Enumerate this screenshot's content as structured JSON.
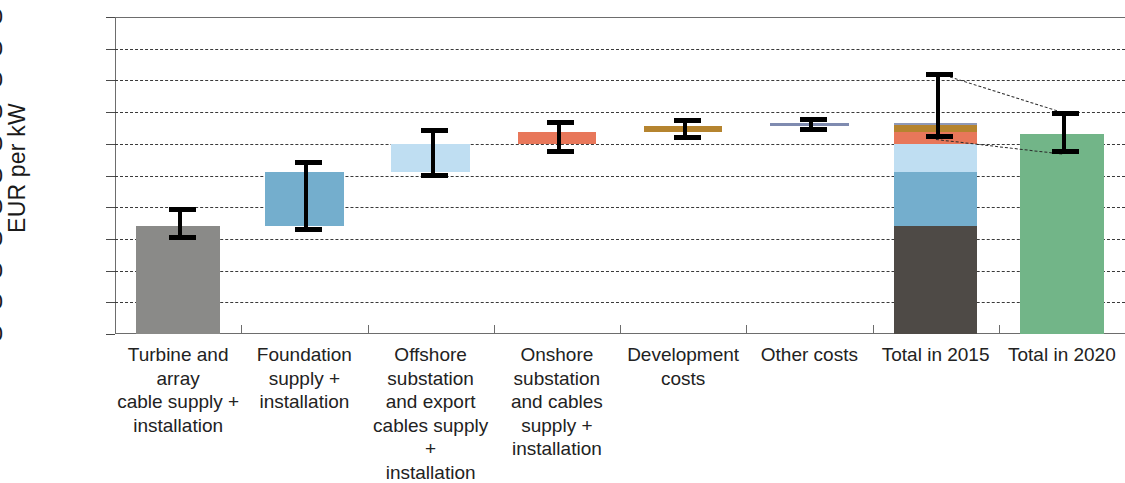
{
  "chart_data": {
    "type": "bar",
    "title": "",
    "subtitle": "",
    "xlabel": "",
    "ylabel": "EUR per kW",
    "ylim": [
      0,
      5000
    ],
    "ytick_interval": 500,
    "grid": "horizontal-dashed",
    "legend": "none",
    "ytick_labels": [
      "5 000",
      "4 500",
      "4 000",
      "3 500",
      "3 000",
      "2 500",
      "2 000",
      "1 500",
      "1 000",
      "500",
      "0"
    ],
    "ytick_values": [
      5000,
      4500,
      4000,
      3500,
      3000,
      2500,
      2000,
      1500,
      1000,
      500,
      0
    ],
    "categories": [
      "Turbine and array cable supply + installation",
      "Foundation supply + installation",
      "Offshore substation and export cables supply + installation",
      "Onshore substation and cables supply + installation",
      "Development costs",
      "Other costs",
      "Total in 2015",
      "Total in 2020"
    ],
    "category_label_lines": [
      [
        "Turbine and array",
        "cable supply +",
        "installation"
      ],
      [
        "Foundation",
        "supply +",
        "installation"
      ],
      [
        "Offshore",
        "substation",
        "and export",
        "cables supply +",
        "installation"
      ],
      [
        "Onshore",
        "substation",
        "and cables",
        "supply +",
        "installation"
      ],
      [
        "Development",
        "costs"
      ],
      [
        "Other costs"
      ],
      [
        "Total in 2015"
      ],
      [
        "Total in 2020"
      ]
    ],
    "bars": [
      {
        "name": "Turbine and array cable supply + installation",
        "kind": "column",
        "base": 0,
        "top": 1700,
        "color": "#8a8a88",
        "error_low": 1490,
        "error_high": 2000
      },
      {
        "name": "Foundation supply + installation",
        "kind": "floating",
        "base": 1700,
        "top": 2560,
        "color": "#74aecd",
        "error_low": 1610,
        "error_high": 2745
      },
      {
        "name": "Offshore substation and export cables supply + installation",
        "kind": "floating",
        "base": 2560,
        "top": 3000,
        "color": "#bfdef2",
        "error_low": 2460,
        "error_high": 3250
      },
      {
        "name": "Onshore substation and cables supply + installation",
        "kind": "floating",
        "base": 3000,
        "top": 3190,
        "color": "#e8775a",
        "error_low": 2840,
        "error_high": 3370
      },
      {
        "name": "Development costs",
        "kind": "floating",
        "base": 3190,
        "top": 3280,
        "color": "#b5842f",
        "error_low": 3060,
        "error_high": 3410
      },
      {
        "name": "Other costs",
        "kind": "floating",
        "base": 3280,
        "top": 3330,
        "color": "#7f8bb0",
        "error_low": 3180,
        "error_high": 3420
      },
      {
        "name": "Total in 2015",
        "kind": "stacked",
        "base": 0,
        "top": 3330,
        "error_low": 3070,
        "error_high": 4140,
        "segments": [
          {
            "name": "Turbine and array cable supply + installation",
            "from": 0,
            "to": 1700,
            "color": "#4e4a46"
          },
          {
            "name": "Foundation supply + installation",
            "from": 1700,
            "to": 2560,
            "color": "#74aecd"
          },
          {
            "name": "Offshore substation and export cables supply + installation",
            "from": 2560,
            "to": 3000,
            "color": "#bfdef2"
          },
          {
            "name": "Onshore substation and cables supply + installation",
            "from": 3000,
            "to": 3190,
            "color": "#e8775a"
          },
          {
            "name": "Development costs",
            "from": 3190,
            "to": 3290,
            "color": "#b5842f"
          },
          {
            "name": "Other costs",
            "from": 3290,
            "to": 3330,
            "color": "#8f99b8"
          }
        ]
      },
      {
        "name": "Total in 2020",
        "kind": "column",
        "base": 0,
        "top": 3160,
        "color": "#72b588",
        "error_low": 2840,
        "error_high": 3510
      }
    ],
    "connectors": [
      {
        "from_value": 4140,
        "to_value": 3510,
        "description": "upper uncertainty connector from 2015 to 2020"
      },
      {
        "from_value": 3070,
        "to_value": 2840,
        "description": "lower uncertainty connector from 2015 to 2020"
      }
    ]
  }
}
